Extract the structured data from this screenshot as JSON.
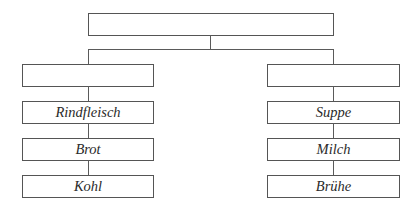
{
  "diagram": {
    "type": "tree",
    "root": {
      "label": ""
    },
    "branches": [
      {
        "header": {
          "label": ""
        },
        "items": [
          {
            "label": "Rindfleisch"
          },
          {
            "label": "Brot"
          },
          {
            "label": "Kohl"
          }
        ]
      },
      {
        "header": {
          "label": ""
        },
        "items": [
          {
            "label": "Suppe"
          },
          {
            "label": "Milch"
          },
          {
            "label": "Brühe"
          }
        ]
      }
    ],
    "colors": {
      "border": "#555555",
      "line": "#5a5a5a",
      "text": "#2a2a2a",
      "background": "#ffffff"
    }
  }
}
